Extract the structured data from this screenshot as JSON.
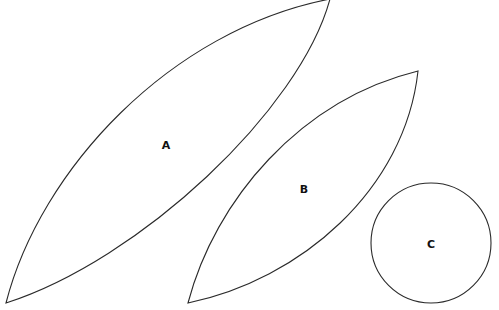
{
  "diagram": {
    "background": "#ffffff",
    "stroke_color": "#2a2a2a",
    "shapes": [
      {
        "id": "A",
        "type": "lens",
        "label": "A",
        "label_pos": [
          166,
          145
        ]
      },
      {
        "id": "B",
        "type": "lens",
        "label": "B",
        "label_pos": [
          304,
          189
        ]
      },
      {
        "id": "C",
        "type": "circle",
        "label": "C",
        "label_pos": [
          431,
          244
        ]
      }
    ]
  }
}
